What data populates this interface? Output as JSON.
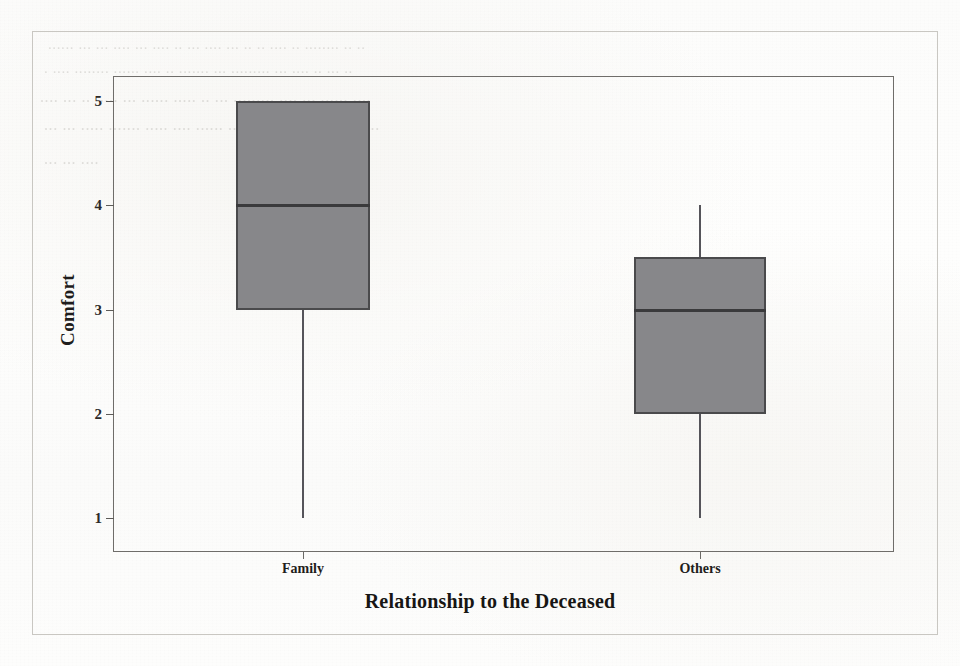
{
  "figure": {
    "kind": "scanned-boxplot-figure",
    "paper_color": "#fcfcfb",
    "outer_border_color": "#c9c7c2",
    "plot_border_color": "#6f6d6a",
    "box_fill_color": "#87878a",
    "box_edge_color": "#4a4a4c",
    "median_color": "#3a3a3c",
    "whisker_color": "#55545a"
  },
  "ghost_text": [
    {
      "text": "......  ...  ...  ....   ...  ....  ..  ...  ....  ...  ..  .. ....  ..  ........  ..  ..",
      "left": 48,
      "top": 36,
      "size": 15
    },
    {
      "text": ".  ....  ........   ......  ....    ..  .......  ...  .........  ...   ....  ..  ...    ..",
      "left": 44,
      "top": 60,
      "size": 15
    },
    {
      "text": "....  ...  ..  .....   ...  ......  .....  ..  ...  .........  ....  ...  ......  ....",
      "left": 40,
      "top": 88,
      "size": 16
    },
    {
      "text": "...  ...   .....  .......  .....  ....  ......  ....  ....  ...  ......  ....  ..  ....",
      "left": 44,
      "top": 116,
      "size": 16
    },
    {
      "text": "...  ...  ....",
      "left": 44,
      "top": 150,
      "size": 16
    }
  ],
  "chart_data": {
    "type": "box",
    "title": "",
    "subtitle": "",
    "xlabel": "Relationship to the Deceased",
    "ylabel": "Comfort",
    "categories": [
      "Family",
      "Others"
    ],
    "ylim": [
      0.55,
      5.45
    ],
    "yticks": [
      1,
      2,
      3,
      4,
      5
    ],
    "ytick_labels": [
      "1",
      "2",
      "3",
      "4",
      "5"
    ],
    "grid": false,
    "legend": null,
    "orientation": "vertical",
    "boxes": [
      {
        "category": "Family",
        "whisker_low": 1,
        "q1": 3,
        "median": 4,
        "q3": 5,
        "whisker_high": 5,
        "upper_whisker_visible": false,
        "outliers": []
      },
      {
        "category": "Others",
        "whisker_low": 1,
        "q1": 2,
        "median": 3,
        "q3": 3.5,
        "whisker_high": 4,
        "upper_whisker_visible": true,
        "outliers": []
      }
    ]
  }
}
